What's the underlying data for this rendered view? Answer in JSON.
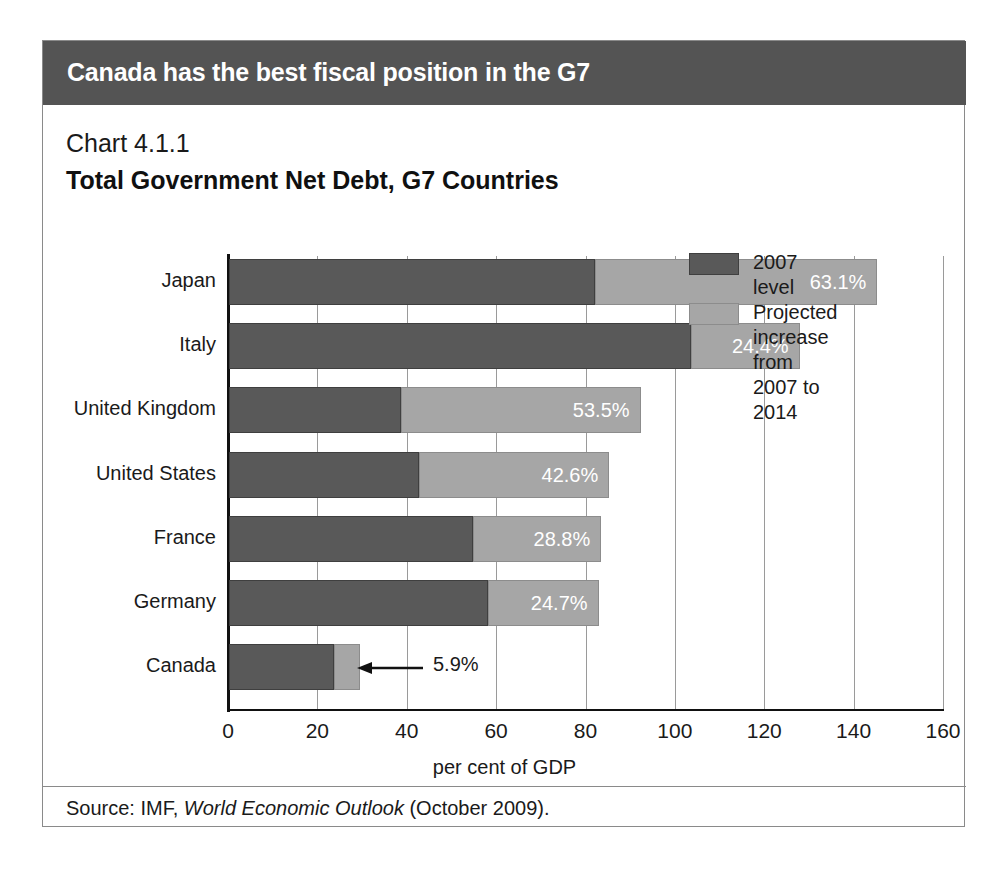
{
  "banner": {
    "title": "Canada has the best fiscal position in the G7",
    "background_color": "#545454",
    "text_color": "#ffffff"
  },
  "chart_number": "Chart 4.1.1",
  "chart_title": "Total Government Net Debt, G7 Countries",
  "source": {
    "prefix": "Source: IMF, ",
    "publication": "World Economic Outlook",
    "suffix": " (October 2009)."
  },
  "legend": {
    "position": "inside-right",
    "items": [
      {
        "label": "2007 level",
        "color": "#595959"
      },
      {
        "label": "Projected increase\nfrom 2007 to 2014",
        "color": "#a6a6a6"
      }
    ]
  },
  "callout": {
    "value_label": "5.9%",
    "target": "Canada",
    "arrow": "left-arrow-icon"
  },
  "chart_data": {
    "type": "bar",
    "orientation": "horizontal",
    "stacked": true,
    "title": "Total Government Net Debt, G7 Countries",
    "subtitle": "Chart 4.1.1",
    "xlabel": "per cent of GDP",
    "ylabel": "",
    "xlim": [
      0,
      160
    ],
    "xticks": [
      0,
      20,
      40,
      60,
      80,
      100,
      120,
      140,
      160
    ],
    "xtick_labels": [
      "0",
      "20",
      "40",
      "60",
      "80",
      "100",
      "120",
      "140",
      "160"
    ],
    "grid": true,
    "grid_axis": "x",
    "legend_position": "inside-right",
    "categories": [
      "Japan",
      "Italy",
      "United Kingdom",
      "United States",
      "France",
      "Germany",
      "Canada"
    ],
    "series": [
      {
        "name": "2007 level",
        "color": "#595959",
        "values": [
          82.0,
          103.3,
          38.6,
          42.5,
          54.5,
          58.0,
          23.5
        ]
      },
      {
        "name": "Projected increase from 2007 to 2014",
        "color": "#a6a6a6",
        "values": [
          63.1,
          24.4,
          53.5,
          42.6,
          28.8,
          24.7,
          5.9
        ]
      }
    ],
    "data_labels": {
      "series": "Projected increase from 2007 to 2014",
      "values": [
        "63.1%",
        "24.4%",
        "53.5%",
        "42.6%",
        "28.8%",
        "24.7%",
        "5.9%"
      ],
      "placement": [
        "inside-right",
        "inside-right",
        "inside-right",
        "inside-right",
        "inside-right",
        "inside-right",
        "outside-callout"
      ]
    },
    "totals": [
      145.1,
      127.7,
      92.1,
      85.1,
      83.3,
      82.7,
      29.4
    ]
  }
}
